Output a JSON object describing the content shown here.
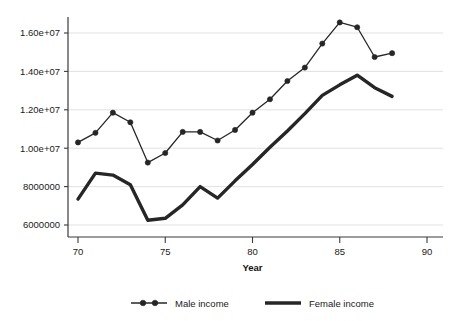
{
  "chart_data": {
    "type": "line",
    "title": "",
    "subtitle": "",
    "xlabel": "Year",
    "ylabel": "",
    "xlim": [
      70,
      90
    ],
    "ylim": [
      6000000,
      17000000
    ],
    "grid": true,
    "legend_position": "bottom",
    "x_ticks": [
      70,
      75,
      80,
      85,
      90
    ],
    "x_tick_labels": [
      "70",
      "75",
      "80",
      "85",
      "90"
    ],
    "y_ticks": [
      6000000,
      8000000,
      10000000,
      12000000,
      14000000,
      16000000
    ],
    "y_tick_labels": [
      "6000000",
      "8000000",
      "1.00e+07",
      "1.20e+07",
      "1.40e+07",
      "1.60e+07"
    ],
    "x": [
      70,
      71,
      72,
      73,
      74,
      75,
      76,
      77,
      78,
      79,
      80,
      81,
      82,
      83,
      84,
      85,
      86,
      87,
      88
    ],
    "series": [
      {
        "name": "Male income",
        "marker": "circle",
        "color": "#262626",
        "values": [
          10300000,
          10800000,
          11850000,
          11350000,
          9250000,
          9750000,
          10850000,
          10850000,
          10400000,
          10950000,
          11850000,
          12550000,
          13500000,
          14200000,
          15450000,
          16550000,
          16300000,
          14750000,
          14950000
        ]
      },
      {
        "name": "Female income",
        "marker": "none",
        "color": "#262626",
        "values": [
          7350000,
          8700000,
          8600000,
          8100000,
          6250000,
          6350000,
          7050000,
          8000000,
          7400000,
          8300000,
          9150000,
          10050000,
          10900000,
          11800000,
          12750000,
          13300000,
          13800000,
          13150000,
          12700000
        ]
      }
    ],
    "legend": [
      {
        "label": "Male income",
        "style": "line-markers"
      },
      {
        "label": "Female income",
        "style": "thick-line"
      }
    ],
    "colors": {
      "series": "#262626",
      "grid": "#d9d9d9",
      "axis": "#3a3a3a",
      "background": "#ffffff"
    }
  }
}
